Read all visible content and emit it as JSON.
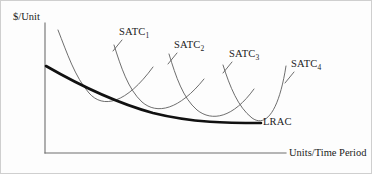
{
  "figure": {
    "kind": "economics-cost-curve-diagram",
    "background_color": "#fdfdfd",
    "border_color": "#cfcfcf"
  },
  "axes": {
    "y_label": "$/Unit",
    "x_label": "Units/Time Period",
    "y_axis": {
      "x": 44,
      "y_top": 22,
      "y_bottom": 152
    },
    "x_axis": {
      "y": 152,
      "x_left": 44,
      "x_right": 285
    },
    "axis_color": "#6e6e6e",
    "ticks": [],
    "grid": false
  },
  "curves": {
    "lrac": {
      "label": "LRAC",
      "color": "#111111",
      "stroke_width": 2.6,
      "path": "M 45,65 C 78,84 112,101 152,112 C 192,122 228,122 260,122",
      "label_x": 262,
      "label_y": 116
    },
    "satc": [
      {
        "label_text": "SATC",
        "subscript": "1",
        "color": "#5d5d5d",
        "stroke_width": 0.9,
        "path": "M 57,29 C 66,52 74,76 88,92 C 102,108 125,103 152,66",
        "leader": "M 121,39 L 112,50",
        "label_x": 118,
        "label_y": 26
      },
      {
        "label_text": "SATC",
        "subscript": "2",
        "color": "#5d5d5d",
        "stroke_width": 0.9,
        "path": "M 113,44 C 120,66 127,88 141,101 C 156,114 178,109 203,78",
        "leader": "M 176,52 L 167,63",
        "label_x": 173,
        "label_y": 39
      },
      {
        "label_text": "SATC",
        "subscript": "3",
        "color": "#5d5d5d",
        "stroke_width": 0.9,
        "path": "M 168,53 C 175,76 182,97 196,109 C 211,121 232,117 253,88",
        "leader": "M 231,61 L 222,72",
        "label_x": 228,
        "label_y": 48
      },
      {
        "label_text": "SATC",
        "subscript": "4",
        "color": "#5d5d5d",
        "stroke_width": 0.9,
        "path": "M 222,64 C 229,86 237,106 251,117 C 265,127 278,110 285,65",
        "leader": "M 293,71 L 284,82",
        "label_x": 290,
        "label_y": 58
      }
    ]
  },
  "chart_data": {
    "type": "line",
    "title": "",
    "xlabel": "Units/Time Period",
    "ylabel": "$/Unit",
    "grid": false,
    "legend": "inline-curve-labels",
    "annotations": [
      "$/Unit",
      "Units/Time Period",
      "SATC1",
      "SATC2",
      "SATC3",
      "SATC4",
      "LRAC"
    ],
    "series": [
      {
        "name": "SATC1",
        "shape": "u-shaped",
        "minimum_x_rel": 0.27,
        "role": "short-run-average-total-cost"
      },
      {
        "name": "SATC2",
        "shape": "u-shaped",
        "minimum_x_rel": 0.46,
        "role": "short-run-average-total-cost"
      },
      {
        "name": "SATC3",
        "shape": "u-shaped",
        "minimum_x_rel": 0.65,
        "role": "short-run-average-total-cost"
      },
      {
        "name": "SATC4",
        "shape": "u-shaped",
        "minimum_x_rel": 0.84,
        "role": "short-run-average-total-cost"
      },
      {
        "name": "LRAC",
        "shape": "downward-sloping-flattening",
        "role": "long-run-average-cost-envelope"
      }
    ]
  }
}
